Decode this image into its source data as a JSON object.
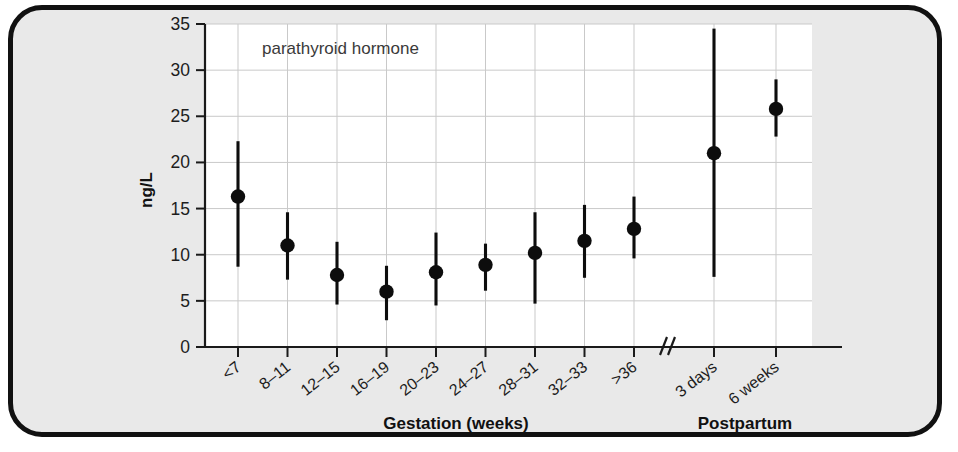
{
  "chart_data": {
    "type": "scatter",
    "title": "",
    "annotation": "parathyroid hormone",
    "xlabel_groups": [
      "Gestation (weeks)",
      "Postpartum"
    ],
    "ylabel": "ng/L",
    "ylim": [
      0,
      35
    ],
    "yticks": [
      0,
      5,
      10,
      15,
      20,
      25,
      30,
      35
    ],
    "grid": true,
    "axis_break": true,
    "axis_break_symbol": "//",
    "legend": "none",
    "categories": [
      "<7",
      "8–11",
      "12–15",
      "16–19",
      "20–23",
      "24–27",
      "28–31",
      "32–33",
      ">36",
      "3 days",
      "6 weeks"
    ],
    "groups": [
      "Gestation (weeks)",
      "Gestation (weeks)",
      "Gestation (weeks)",
      "Gestation (weeks)",
      "Gestation (weeks)",
      "Gestation (weeks)",
      "Gestation (weeks)",
      "Gestation (weeks)",
      "Gestation (weeks)",
      "Postpartum",
      "Postpartum"
    ],
    "series": [
      {
        "name": "parathyroid hormone",
        "values": [
          16.3,
          11.0,
          7.8,
          6.0,
          8.1,
          8.9,
          10.2,
          11.5,
          12.8,
          21.0,
          25.8
        ],
        "lower": [
          8.7,
          7.3,
          4.6,
          2.9,
          4.5,
          6.1,
          4.7,
          7.5,
          9.6,
          7.6,
          22.8
        ],
        "upper": [
          22.3,
          14.6,
          11.4,
          8.8,
          12.4,
          11.2,
          14.6,
          15.4,
          16.3,
          34.5,
          29.0
        ]
      }
    ]
  },
  "figure": {
    "annotation": "parathyroid hormone",
    "y_axis_label": "ng/L",
    "x_group_label_left": "Gestation (weeks)",
    "x_group_label_right": "Postpartum",
    "break_symbol": "//",
    "colors": {
      "page_background": "#e9e9e9",
      "frame_border": "#111111",
      "plot_background": "#ffffff",
      "gridline": "#c9c9c9",
      "axis": "#1a1a1a",
      "marker": "#0d0d0d"
    }
  }
}
